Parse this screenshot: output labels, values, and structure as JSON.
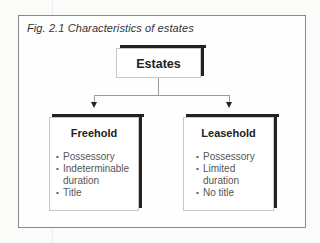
{
  "figure": {
    "title": "Fig. 2.1  Characteristics of estates"
  },
  "root": {
    "label": "Estates"
  },
  "branches": [
    {
      "label": "Freehold",
      "items": [
        {
          "bullet": "•",
          "text": "Possessory"
        },
        {
          "bullet": "•",
          "text": "Indeterminable",
          "continuation": "duration"
        },
        {
          "bullet": "•",
          "text": "Title"
        }
      ]
    },
    {
      "label": "Leasehold",
      "items": [
        {
          "bullet": "•",
          "text": "Possessory"
        },
        {
          "bullet": "•",
          "text": "Limited",
          "continuation": "duration"
        },
        {
          "bullet": "•",
          "text": "No title"
        }
      ]
    }
  ],
  "colors": {
    "frame": "#8a8a8a",
    "shadow": "#222222",
    "connector": "#9a9a9a",
    "list_text": "#555555"
  }
}
